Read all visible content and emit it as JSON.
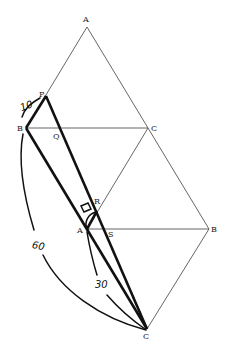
{
  "diagram": {
    "points": {
      "A_top": {
        "label": "A",
        "x": 87,
        "y": 27
      },
      "P": {
        "label": "P",
        "x": 46,
        "y": 96
      },
      "B_left": {
        "label": "B",
        "x": 26,
        "y": 128
      },
      "Q": {
        "label": "Q",
        "x": 61,
        "y": 128
      },
      "C_mid": {
        "label": "C",
        "x": 148,
        "y": 128
      },
      "R": {
        "label": "R",
        "x": 97,
        "y": 211
      },
      "A_mid": {
        "label": "A",
        "x": 87,
        "y": 229
      },
      "S": {
        "label": "S",
        "x": 108,
        "y": 229
      },
      "B_right": {
        "label": "B",
        "x": 209,
        "y": 229
      },
      "C_bottom": {
        "label": "C",
        "x": 147,
        "y": 329
      }
    },
    "labels": {
      "A_top": "A",
      "P": "P",
      "B_left": "B",
      "Q": "Q",
      "C_mid": "C",
      "R": "R",
      "A_mid": "A",
      "S": "S",
      "B_right": "B",
      "C_bottom": "C"
    },
    "measurements": {
      "PB": "10",
      "BC_arc": "60",
      "AC_arc": "30"
    },
    "right_angle_marker": "□"
  }
}
